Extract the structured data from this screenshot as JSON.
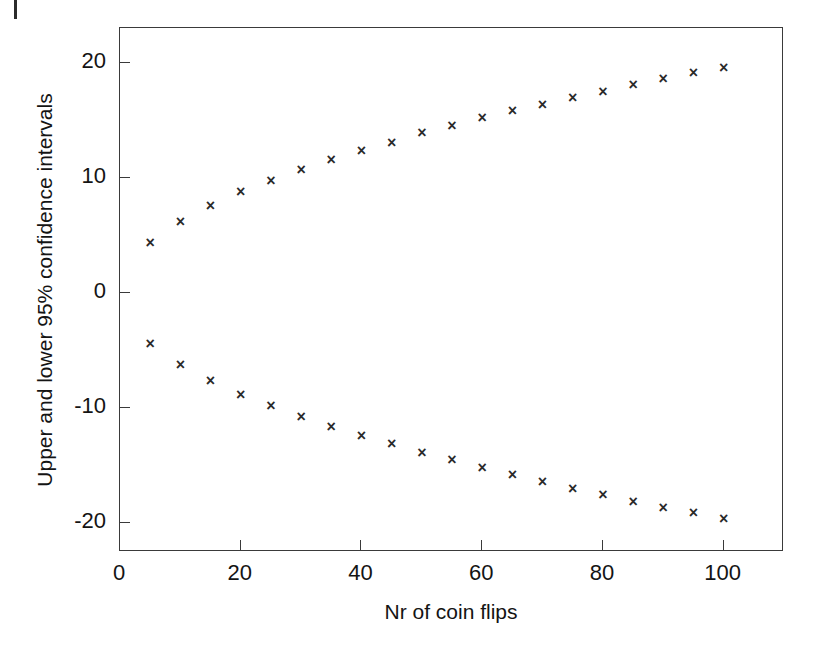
{
  "chart_data": {
    "type": "scatter",
    "title": "",
    "xlabel": "Nr of coin flips",
    "ylabel": "Upper and lower 95% confidence intervals",
    "xlim": [
      0,
      110
    ],
    "ylim": [
      -22.5,
      23
    ],
    "grid": false,
    "legend": "none",
    "marker": "x",
    "marker_color": "#2a2a2a",
    "xticks": [
      0,
      20,
      40,
      60,
      80,
      100
    ],
    "xticklabels": [
      "0",
      "20",
      "40",
      "60",
      "80",
      "100"
    ],
    "yticks": [
      20,
      10,
      0,
      -10,
      -20
    ],
    "yticklabels": [
      "20",
      "10",
      "0",
      "-10",
      "-20"
    ],
    "x": [
      5,
      10,
      15,
      20,
      25,
      30,
      35,
      40,
      45,
      50,
      55,
      60,
      65,
      70,
      75,
      80,
      85,
      90,
      95,
      100
    ],
    "series": [
      {
        "name": "Upper 95% confidence interval",
        "values": [
          4.4,
          6.2,
          7.6,
          8.8,
          9.8,
          10.7,
          11.6,
          12.4,
          13.1,
          13.9,
          14.5,
          15.2,
          15.8,
          16.4,
          17.0,
          17.5,
          18.1,
          18.6,
          19.1,
          19.6
        ]
      },
      {
        "name": "Lower 95% confidence interval",
        "values": [
          -4.4,
          -6.2,
          -7.6,
          -8.8,
          -9.8,
          -10.7,
          -11.6,
          -12.4,
          -13.1,
          -13.9,
          -14.5,
          -15.2,
          -15.8,
          -16.4,
          -17.0,
          -17.5,
          -18.1,
          -18.6,
          -19.1,
          -19.6
        ]
      }
    ]
  }
}
